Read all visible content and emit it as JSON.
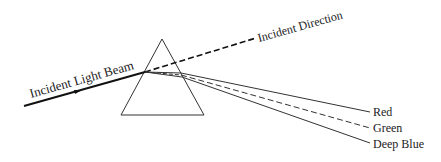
{
  "diagram": {
    "labels": {
      "incident_beam": "Incident Light Beam",
      "incident_direction": "Incident Direction",
      "red": "Red",
      "green": "Green",
      "deep_blue": "Deep Blue"
    },
    "colors": {
      "line": "#222222",
      "background": "#ffffff"
    }
  }
}
